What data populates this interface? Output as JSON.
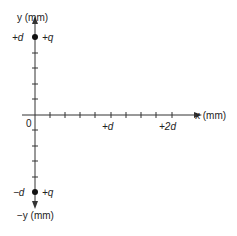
{
  "diagram": {
    "axes": {
      "y_label": "y (mm)",
      "x_label": "x (mm)",
      "neg_y_label": "−y (mm)",
      "origin_label": "0",
      "x_ticks": [
        "+d",
        "+2d"
      ],
      "y_ticks_pos": "+d",
      "y_ticks_neg": "−d"
    },
    "charges": [
      {
        "label": "+q",
        "position": "+d on y-axis"
      },
      {
        "label": "+q",
        "position": "−d on y-axis"
      }
    ],
    "colors": {
      "line": "#333333",
      "charge": "#111111"
    }
  }
}
